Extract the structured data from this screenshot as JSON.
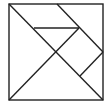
{
  "diagram": {
    "type": "tangram",
    "background": "#ffffff",
    "stroke_color": "#222222",
    "stroke_width": 1.4,
    "square": {
      "x": 9,
      "y": 4,
      "width": 94,
      "height": 96
    },
    "lines": [
      {
        "name": "main-diagonal",
        "x1": 9,
        "y1": 4,
        "x2": 103,
        "y2": 100
      },
      {
        "name": "top-right-diagonal",
        "x1": 57,
        "y1": 4,
        "x2": 103,
        "y2": 52
      },
      {
        "name": "horizontal-segment",
        "x1": 34,
        "y1": 28,
        "x2": 79,
        "y2": 28
      },
      {
        "name": "anti-diagonal",
        "x1": 79,
        "y1": 28,
        "x2": 9,
        "y2": 100
      },
      {
        "name": "right-small-segment",
        "x1": 103,
        "y1": 52,
        "x2": 80,
        "y2": 76
      }
    ]
  }
}
